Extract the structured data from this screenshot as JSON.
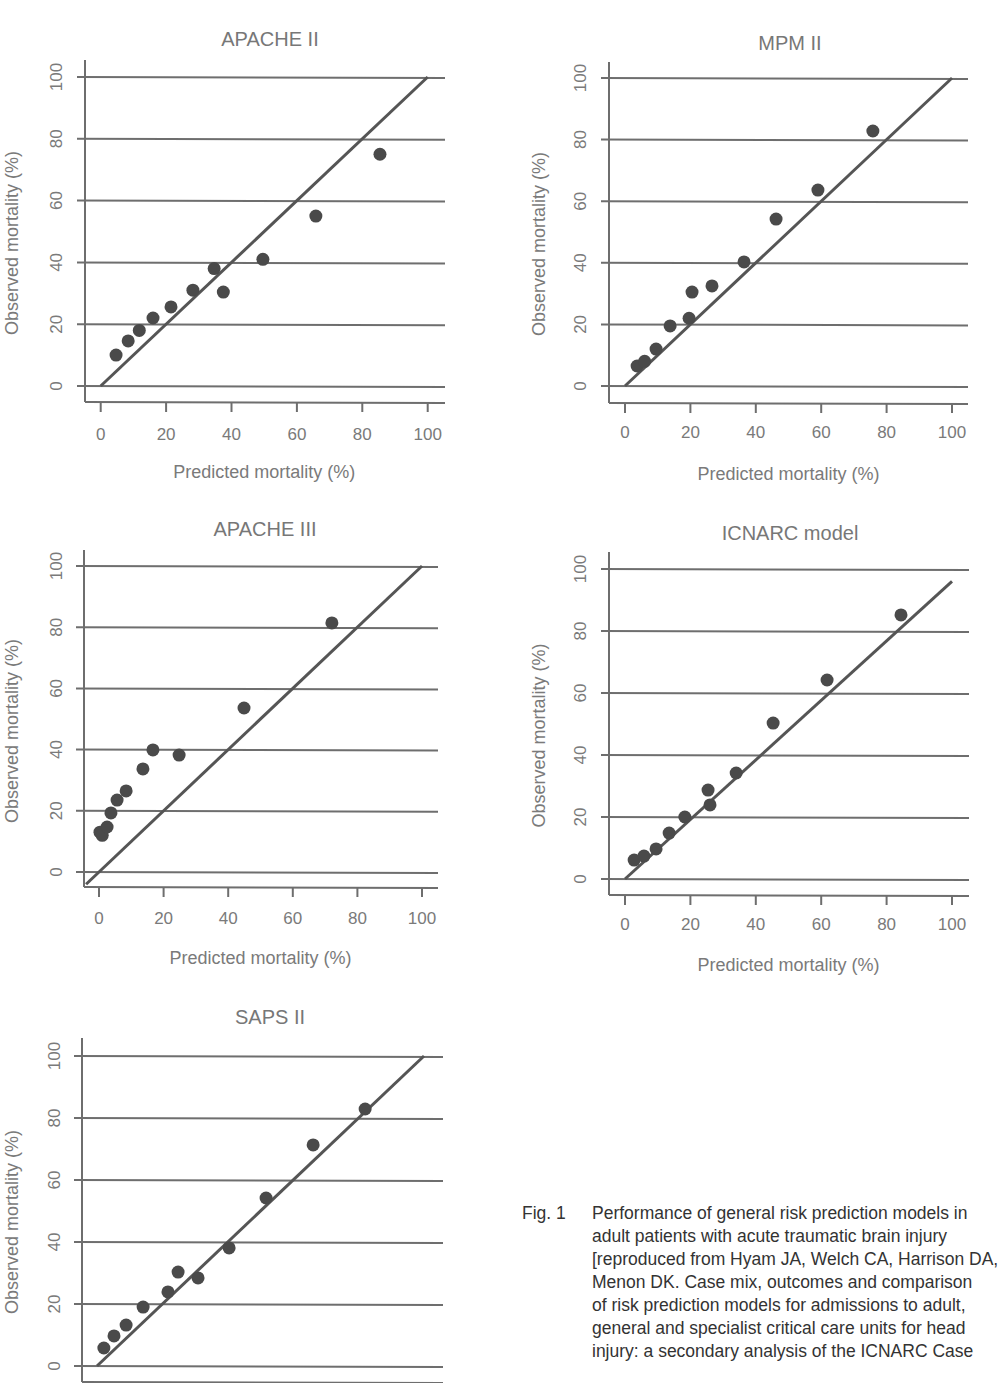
{
  "figure": {
    "caption_label": "Fig. 1",
    "caption_text": "Performance of general risk prediction models in\nadult patients with acute traumatic brain injury\n[reproduced from Hyam JA, Welch CA, Harrison DA,\nMenon DK. Case mix, outcomes and comparison\nof risk prediction models for admissions to adult,\ngeneral and specialist critical care units for head\ninjury: a secondary analysis of the ICNARC Case"
  },
  "colors": {
    "grid": "#6e6e6e",
    "points": "#4a4a4a",
    "axis_text": "#7a7a7a",
    "title_text": "#777777"
  },
  "chart_data": [
    {
      "type": "scatter",
      "title": "APACHE II",
      "xlabel": "Predicted mortality (%)",
      "ylabel": "Observed mortality (%)",
      "xlim": [
        0,
        100
      ],
      "ylim": [
        0,
        100
      ],
      "xticks": [
        0,
        20,
        40,
        60,
        80,
        100
      ],
      "yticks": [
        0,
        20,
        40,
        60,
        80,
        100
      ],
      "grid": "horizontal",
      "reference_line": {
        "x": [
          0,
          100
        ],
        "y": [
          0,
          100
        ]
      },
      "points": [
        [
          4.7,
          10
        ],
        [
          8.4,
          14.6
        ],
        [
          11.8,
          18
        ],
        [
          16,
          22
        ],
        [
          21.5,
          25.6
        ],
        [
          28.2,
          31
        ],
        [
          34.7,
          38
        ],
        [
          37.5,
          30.4
        ],
        [
          49.6,
          41
        ],
        [
          65.8,
          55
        ],
        [
          85.4,
          75
        ]
      ]
    },
    {
      "type": "scatter",
      "title": "MPM II",
      "xlabel": "Predicted mortality (%)",
      "ylabel": "Observed mortality (%)",
      "xlim": [
        0,
        100
      ],
      "ylim": [
        0,
        100
      ],
      "xticks": [
        0,
        20,
        40,
        60,
        80,
        100
      ],
      "yticks": [
        0,
        20,
        40,
        60,
        80,
        100
      ],
      "grid": "horizontal",
      "reference_line": {
        "x": [
          0,
          100
        ],
        "y": [
          0,
          100
        ]
      },
      "points": [
        [
          3.7,
          6.5
        ],
        [
          6,
          8
        ],
        [
          9.5,
          12
        ],
        [
          13.8,
          19.5
        ],
        [
          19.6,
          22
        ],
        [
          20.5,
          30.5
        ],
        [
          26.6,
          32.5
        ],
        [
          36.4,
          40.3
        ],
        [
          46.2,
          54.2
        ],
        [
          59,
          63.6
        ],
        [
          75.8,
          82.8
        ]
      ]
    },
    {
      "type": "scatter",
      "title": "APACHE III",
      "xlabel": "Predicted mortality (%)",
      "ylabel": "Observed mortality (%)",
      "xlim": [
        0,
        100
      ],
      "ylim": [
        0,
        100
      ],
      "xticks": [
        0,
        20,
        40,
        60,
        80,
        100
      ],
      "yticks": [
        0,
        20,
        40,
        60,
        80,
        100
      ],
      "grid": "horizontal",
      "reference_line": {
        "x": [
          -4,
          100
        ],
        "y": [
          -4,
          100
        ]
      },
      "points": [
        [
          0.3,
          13
        ],
        [
          1,
          12
        ],
        [
          2.5,
          14.7
        ],
        [
          3.7,
          19.3
        ],
        [
          5.6,
          23.5
        ],
        [
          8.4,
          26.5
        ],
        [
          13.6,
          33.7
        ],
        [
          16.7,
          39.9
        ],
        [
          24.8,
          38.2
        ],
        [
          44.9,
          53.6
        ],
        [
          72.1,
          81.4
        ]
      ]
    },
    {
      "type": "scatter",
      "title": "ICNARC model",
      "xlabel": "Predicted mortality (%)",
      "ylabel": "Observed mortality (%)",
      "xlim": [
        0,
        100
      ],
      "ylim": [
        0,
        100
      ],
      "xticks": [
        0,
        20,
        40,
        60,
        80,
        100
      ],
      "yticks": [
        0,
        20,
        40,
        60,
        80,
        100
      ],
      "grid": "horizontal",
      "reference_line": {
        "x": [
          0,
          100
        ],
        "y": [
          0,
          96
        ]
      },
      "points": [
        [
          2.8,
          6.1
        ],
        [
          5.8,
          7.4
        ],
        [
          9.5,
          9.7
        ],
        [
          13.5,
          14.8
        ],
        [
          18.3,
          20
        ],
        [
          25.4,
          28.7
        ],
        [
          26,
          23.9
        ],
        [
          34,
          34.2
        ],
        [
          45.3,
          50.3
        ],
        [
          61.8,
          64.2
        ],
        [
          84.4,
          85.2
        ]
      ]
    },
    {
      "type": "scatter",
      "title": "SAPS II",
      "xlabel": "Predicted mortality (%)",
      "ylabel": "Observed mortality (%)",
      "xlim": [
        0,
        100
      ],
      "ylim": [
        0,
        100
      ],
      "xticks": [],
      "yticks": [
        0,
        20,
        40,
        60,
        80,
        100
      ],
      "grid": "horizontal",
      "reference_line": {
        "x": [
          0,
          100
        ],
        "y": [
          0,
          100
        ]
      },
      "points": [
        [
          2.1,
          5.8
        ],
        [
          5.2,
          9.7
        ],
        [
          8.9,
          13.2
        ],
        [
          14.1,
          19
        ],
        [
          21.7,
          23.9
        ],
        [
          24.8,
          30.3
        ],
        [
          30.9,
          28.4
        ],
        [
          40.4,
          38.1
        ],
        [
          51.7,
          54.2
        ],
        [
          66.1,
          71.3
        ],
        [
          82,
          82.9
        ]
      ]
    }
  ]
}
